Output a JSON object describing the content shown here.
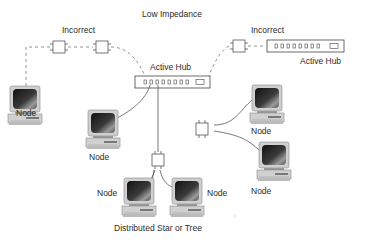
{
  "title": "Low Impedance",
  "caption": "Distributed Star or Tree",
  "labels": {
    "incorrect_left": "Incorrect",
    "incorrect_right": "Incorrect",
    "active_hub_center": "Active Hub",
    "active_hub_right": "Active Hub",
    "node_top_left": "Node",
    "node_mid_left": "Node",
    "node_right_upper": "Node",
    "node_right_lower": "Node",
    "node_bottom_left": "Node",
    "node_bottom_right": "Node"
  },
  "colors": {
    "line": "#555555",
    "dashed": "#888888",
    "hub_border": "#444444",
    "screen_dark": "#1e1e1e",
    "case": "#c8c8c8"
  },
  "icons": {
    "computer": "computer-node-icon",
    "connector": "balun-connector-icon",
    "hub": "active-hub-icon"
  }
}
